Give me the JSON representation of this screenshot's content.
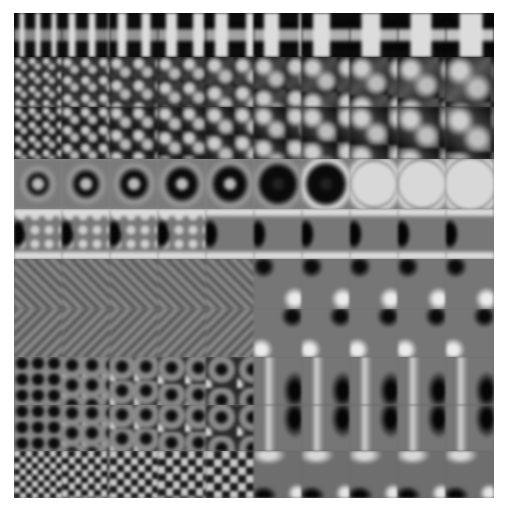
{
  "image": {
    "description": "Grayscale tableau of 10x10 simulated lattice images; pattern scale increases from left to right within each row",
    "grid": {
      "rows": 10,
      "columns": 10
    },
    "frame": {
      "x": 14,
      "y": 13,
      "width": 480,
      "height": 485
    },
    "background": "#ffffff",
    "colors": {
      "dark": "#0a0a0a",
      "mid": "#7a7a7a",
      "light": "#dcdcdc"
    },
    "rows": [
      {
        "index": 0,
        "top": 0,
        "height": 44,
        "pattern": "cross-grid",
        "bg": "#0c0c0c"
      },
      {
        "index": 1,
        "top": 44,
        "height": 50,
        "pattern": "diagonal-checker",
        "bg": "#2a2a2a"
      },
      {
        "index": 2,
        "top": 94,
        "height": 52,
        "pattern": "diagonal-checker-b",
        "bg": "#3a3a3a"
      },
      {
        "index": 3,
        "top": 146,
        "height": 50,
        "pattern": "square-rings",
        "bg": "#8a8a8a"
      },
      {
        "index": 4,
        "top": 196,
        "height": 50,
        "pattern": "dots-bands",
        "bg": "#7a7a7a"
      },
      {
        "index": 5,
        "top": 246,
        "height": 50,
        "pattern": "diag-dots",
        "bg": "#707070"
      },
      {
        "index": 6,
        "top": 296,
        "height": 48,
        "pattern": "diag-dots-b",
        "bg": "#747474"
      },
      {
        "index": 7,
        "top": 344,
        "height": 48,
        "pattern": "hex-rings",
        "bg": "#6e6e6e"
      },
      {
        "index": 8,
        "top": 392,
        "height": 46,
        "pattern": "hex-rings-b",
        "bg": "#6a6a6a"
      },
      {
        "index": 9,
        "top": 438,
        "height": 47,
        "pattern": "checker",
        "bg": "#6c6c6c"
      }
    ]
  }
}
